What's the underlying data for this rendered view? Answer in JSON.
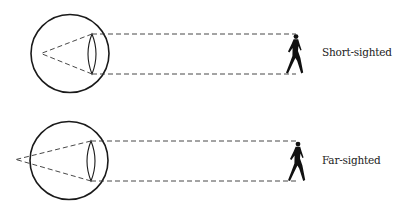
{
  "diagram": {
    "type": "vision-defects",
    "colors": {
      "stroke": "#1a1a1a",
      "background": "#ffffff",
      "text": "#222222"
    },
    "panels": [
      {
        "id": "short-sighted",
        "label": "Short-sighted",
        "eye": {
          "cx": 70,
          "cy": 53.5,
          "r": 39
        },
        "lens": {
          "x": 92,
          "top": 34,
          "bottom": 74
        },
        "focal_point": {
          "x": 41,
          "y": 53.5,
          "position": "inside-eye"
        },
        "rays_to_object": {
          "from_x": 92,
          "to_x": 296,
          "y_top": 34,
          "y_bottom": 74
        },
        "object": "walking-person"
      },
      {
        "id": "far-sighted",
        "label": "Far-sighted",
        "eye": {
          "cx": 69,
          "cy": 160.5,
          "r": 39
        },
        "lens": {
          "x": 91,
          "top": 141,
          "bottom": 181
        },
        "focal_point": {
          "x": 16,
          "y": 159.5,
          "position": "behind-eye"
        },
        "rays_to_object": {
          "from_x": 91,
          "to_x": 298,
          "y_top": 141,
          "y_bottom": 181
        },
        "object": "walking-person"
      }
    ]
  }
}
